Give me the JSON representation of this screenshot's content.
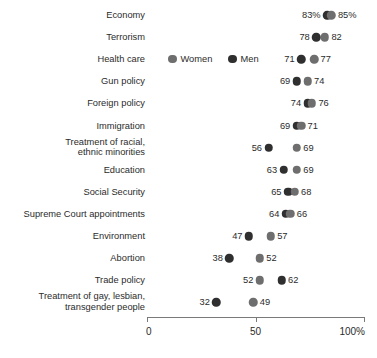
{
  "legend": {
    "women_label": "Women",
    "men_label": "Men",
    "women_color": "#6e6e6e",
    "men_color": "#2f2f2f",
    "row_index": 2
  },
  "axis": {
    "ticks": [
      "0",
      "50",
      "100%"
    ],
    "tick_values": [
      0,
      50,
      100
    ]
  },
  "chart_data": {
    "type": "scatter",
    "title": "",
    "xlabel": "",
    "ylabel": "",
    "xlim": [
      0,
      100
    ],
    "grid": false,
    "legend_position": "inline-row-3",
    "categories": [
      "Economy",
      "Terrorism",
      "Health care",
      "Gun policy",
      "Foreign policy",
      "Immigration",
      "Treatment of racial,\nethnic minorities",
      "Education",
      "Social Security",
      "Supreme Court appointments",
      "Environment",
      "Abortion",
      "Trade policy",
      "Treatment of gay, lesbian,\ntransgender people"
    ],
    "series": [
      {
        "name": "Men",
        "color": "#2f2f2f",
        "values": [
          83,
          78,
          71,
          69,
          74,
          69,
          56,
          63,
          65,
          64,
          47,
          38,
          62,
          32
        ],
        "labels": [
          "83%",
          "78",
          "71",
          "69",
          "74",
          "69",
          "56",
          "63",
          "65",
          "64",
          "47",
          "38",
          "62",
          "32"
        ]
      },
      {
        "name": "Women",
        "color": "#6e6e6e",
        "values": [
          85,
          82,
          77,
          74,
          76,
          71,
          69,
          69,
          68,
          66,
          57,
          52,
          52,
          49
        ],
        "labels": [
          "85%",
          "82",
          "77",
          "74",
          "76",
          "71",
          "69",
          "69",
          "68",
          "66",
          "57",
          "52",
          "52",
          "49"
        ]
      }
    ],
    "rows": [
      {
        "category": "Economy",
        "men": 83,
        "women": 85,
        "men_label": "83%",
        "women_label": "85%"
      },
      {
        "category": "Terrorism",
        "men": 78,
        "women": 82,
        "men_label": "78",
        "women_label": "82"
      },
      {
        "category": "Health care",
        "men": 71,
        "women": 77,
        "men_label": "71",
        "women_label": "77"
      },
      {
        "category": "Gun policy",
        "men": 69,
        "women": 74,
        "men_label": "69",
        "women_label": "74"
      },
      {
        "category": "Foreign policy",
        "men": 74,
        "women": 76,
        "men_label": "74",
        "women_label": "76"
      },
      {
        "category": "Immigration",
        "men": 69,
        "women": 71,
        "men_label": "69",
        "women_label": "71"
      },
      {
        "category": "Treatment of racial,\nethnic minorities",
        "men": 56,
        "women": 69,
        "men_label": "56",
        "women_label": "69"
      },
      {
        "category": "Education",
        "men": 63,
        "women": 69,
        "men_label": "63",
        "women_label": "69"
      },
      {
        "category": "Social Security",
        "men": 65,
        "women": 68,
        "men_label": "65",
        "women_label": "68"
      },
      {
        "category": "Supreme Court appointments",
        "men": 64,
        "women": 66,
        "men_label": "64",
        "women_label": "66"
      },
      {
        "category": "Environment",
        "men": 47,
        "women": 57,
        "men_label": "47",
        "women_label": "57"
      },
      {
        "category": "Abortion",
        "men": 38,
        "women": 52,
        "men_label": "38",
        "women_label": "52"
      },
      {
        "category": "Trade policy",
        "men": 62,
        "women": 52,
        "men_label": "62",
        "women_label": "52"
      },
      {
        "category": "Treatment of gay, lesbian,\ntransgender people",
        "men": 32,
        "women": 49,
        "men_label": "32",
        "women_label": "49"
      }
    ]
  }
}
